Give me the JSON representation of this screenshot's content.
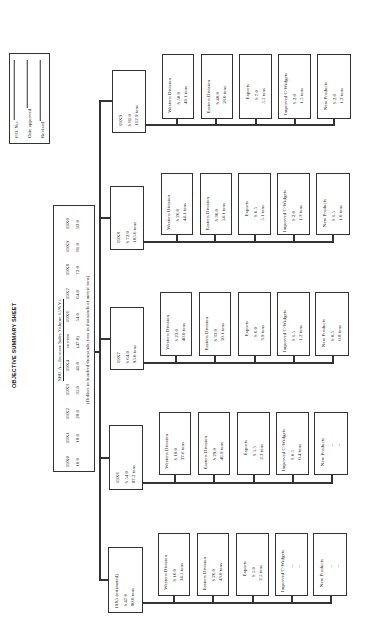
{
  "title": "OBJECTIVE SUMMARY SHEET",
  "form": {
    "po_label": "P.O. No.",
    "date_label": "Date approved",
    "revised_label": "Revised"
  },
  "summary": {
    "heading": "SBU A—Increase Sales Volume 15% Yr.",
    "note": "(Dollars in hundred thousands; tons in thousands of metric tons)",
    "years": [
      "19X0",
      "19X1",
      "19X2",
      "19X3",
      "19X4",
      "current",
      "19X6",
      "19X7",
      "19X8",
      "19X9",
      "19X0"
    ],
    "values": [
      "10.0",
      "18.0",
      "28.0",
      "35.0",
      "41.0",
      "(47.0)",
      "54.0",
      "64.0",
      "72.0",
      "81.0",
      "93.0"
    ]
  },
  "years": [
    {
      "label": "19X9",
      "dollars": "$ 81.0",
      "tons": "112.9 tons",
      "children": [
        {
          "name": "Western Division",
          "dollars": "$ 50.0",
          "tons": "49.1 tons"
        },
        {
          "name": "Eastern Division",
          "dollars": "$ 40.0",
          "tons": "58.0 tons"
        },
        {
          "name": "Exports",
          "dollars": "$ 7.0",
          "tons": "5.5 tons"
        },
        {
          "name": "Improved C-Widgets",
          "dollars": "$ 2.0",
          "tons": "1.5 tons"
        },
        {
          "name": "New Products",
          "dollars": "$ 2.0",
          "tons": "1.2 tons"
        }
      ]
    },
    {
      "label": "19X8",
      "dollars": "$ 72.0",
      "tons": "105.6 tons",
      "children": [
        {
          "name": "Western Division",
          "dollars": "$ 26.0",
          "tons": "44.1 tons"
        },
        {
          "name": "Eastern Division",
          "dollars": "$ 36.0",
          "tons": "54.1 tons"
        },
        {
          "name": "Exports",
          "dollars": "$ 6.5",
          "tons": "5.1 tons"
        },
        {
          "name": "Improved C-Widgets",
          "dollars": "$ 2.0",
          "tons": "1.3 tons"
        },
        {
          "name": "New Products",
          "dollars": "$ 1.5",
          "tons": "1.0 tons"
        }
      ]
    },
    {
      "label": "19X7",
      "dollars": "$ 64.0",
      "tons": "95.0 tons",
      "children": [
        {
          "name": "Western Division",
          "dollars": "$ 23.0",
          "tons": "40.0 tons"
        },
        {
          "name": "Eastern Division",
          "dollars": "$ 33.0",
          "tons": "50.1 tons"
        },
        {
          "name": "Exports",
          "dollars": "$ 6.0",
          "tons": "3.9 tons"
        },
        {
          "name": "Improved C-Widgets",
          "dollars": "$ 1.5",
          "tons": "1.2 tons"
        },
        {
          "name": "New Products",
          "dollars": "$ 0.5",
          "tons": "0.8 tons"
        }
      ]
    },
    {
      "label": "19X6",
      "dollars": "$ 54.0",
      "tons": "87.2 tons",
      "children": [
        {
          "name": "Western Division",
          "dollars": "$ 19.0",
          "tons": "37.6 tons"
        },
        {
          "name": "Eastern Division",
          "dollars": "$ 29.0",
          "tons": "46.9 tons"
        },
        {
          "name": "Exports",
          "dollars": "$ 5.5",
          "tons": "2.3 tons"
        },
        {
          "name": "Improved C-Widgets",
          "dollars": "$ 0.5",
          "tons": "0.4 tons"
        },
        {
          "name": "New Products",
          "dollars": "–",
          "tons": "–"
        }
      ]
    },
    {
      "label": "19X5 (estimated)",
      "dollars": "$ 47.0",
      "tons": "80.0 tons",
      "children": [
        {
          "name": "Western Division",
          "dollars": "$ 16.0",
          "tons": "34.5 tons"
        },
        {
          "name": "Eastern Division",
          "dollars": "$ 26.0",
          "tons": "43.0 tons"
        },
        {
          "name": "Exports",
          "dollars": "$ 5.0",
          "tons": "2.5 tons"
        },
        {
          "name": "Improved C-Widgets",
          "dollars": "–",
          "tons": "–"
        },
        {
          "name": "New Products",
          "dollars": "–",
          "tons": "–"
        }
      ]
    }
  ]
}
